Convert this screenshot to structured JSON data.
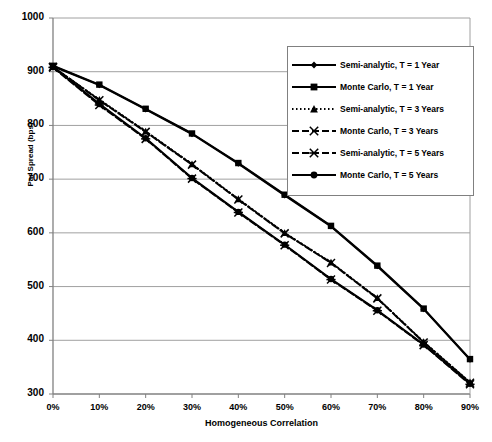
{
  "chart_data": {
    "type": "line",
    "title": "",
    "xlabel": "Homogeneous Correlation",
    "ylabel": "Par Spread (bps)",
    "x": [
      0,
      10,
      20,
      30,
      40,
      50,
      60,
      70,
      80,
      90
    ],
    "xtick_labels": [
      "0%",
      "10%",
      "20%",
      "30%",
      "40%",
      "50%",
      "60%",
      "70%",
      "80%",
      "90%"
    ],
    "ytick_labels": [
      "300",
      "400",
      "500",
      "600",
      "700",
      "800",
      "900",
      "1000"
    ],
    "ylim": [
      300,
      1000
    ],
    "xlim": [
      0,
      90
    ],
    "ytick_step": 100,
    "grid": "horizontal",
    "legend_position": "top-right",
    "series": [
      {
        "name": "Semi-analytic, T = 1 Year",
        "marker": "diamond",
        "line": "solid",
        "values": [
          910,
          875,
          830,
          784,
          729,
          670,
          612,
          538,
          458,
          364
        ]
      },
      {
        "name": "Monte Carlo, T = 1 Year",
        "marker": "square",
        "line": "solid",
        "values": [
          911,
          876,
          831,
          785,
          730,
          671,
          613,
          539,
          459,
          365
        ]
      },
      {
        "name": "Semi-analytic, T = 3 Years",
        "marker": "triangle",
        "line": "dotted",
        "values": [
          909,
          848,
          789,
          728,
          663,
          600,
          545,
          479,
          397,
          322
        ]
      },
      {
        "name": "Monte Carlo, T = 3 Years",
        "marker": "x",
        "line": "dashed",
        "values": [
          909,
          847,
          788,
          727,
          662,
          599,
          544,
          478,
          396,
          321
        ]
      },
      {
        "name": "Semi-analytic, T = 5 Years",
        "marker": "asterisk",
        "line": "dashed",
        "values": [
          908,
          838,
          775,
          701,
          638,
          577,
          513,
          455,
          391,
          318
        ]
      },
      {
        "name": "Monte Carlo, T = 5 Years",
        "marker": "circle",
        "line": "solid",
        "values": [
          909,
          840,
          776,
          702,
          639,
          578,
          514,
          456,
          392,
          319
        ]
      }
    ],
    "colors": {
      "line": "#000000",
      "grid": "#a0a0a0",
      "axis": "#808080",
      "background": "#ffffff"
    }
  }
}
